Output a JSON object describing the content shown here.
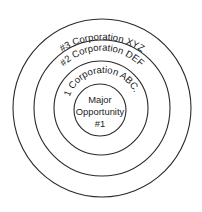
{
  "diagram": {
    "type": "concentric-circles",
    "center": {
      "lines": [
        "Major",
        "Opportunity",
        "#1"
      ]
    },
    "rings": [
      {
        "label": "#1 Corporation ABC...",
        "level": 1
      },
      {
        "label": "#2 Corporation DEF",
        "level": 2
      },
      {
        "label": "#3 Corporation XYZ",
        "level": 3
      }
    ],
    "colors": {
      "stroke": "#2a2a2a",
      "text": "#1c1c1c",
      "background": "#ffffff"
    }
  }
}
